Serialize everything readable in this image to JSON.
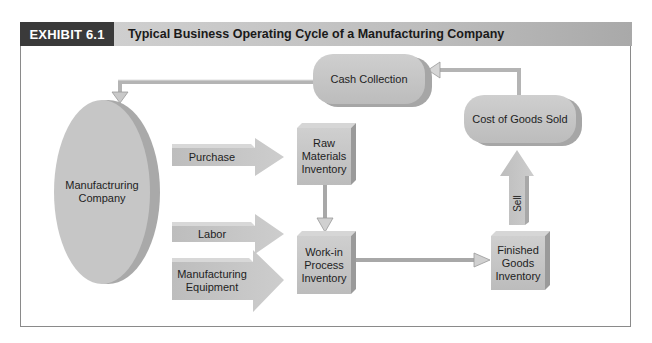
{
  "header": {
    "exhibit_label": "EXHIBIT 6.1",
    "title": "Typical Business Operating Cycle of a Manufacturing Company"
  },
  "nodes": {
    "company": "Manufactruring Company",
    "raw_materials": "Raw Materials Inventory",
    "wip": "Work-in Process Inventory",
    "finished_goods": "Finished Goods Inventory",
    "cogs": "Cost of Goods Sold",
    "cash_collection": "Cash Collection"
  },
  "inputs": {
    "purchase": "Purchase",
    "labor": "Labor",
    "equipment": "Manufacturing Equipment"
  },
  "flows": {
    "sell": "Sell"
  },
  "colors": {
    "badge": "#3a3a3a",
    "shape_fill": "#c4c4c4",
    "shape_dark": "#9e9e9e",
    "line": "#a8a8a8"
  }
}
